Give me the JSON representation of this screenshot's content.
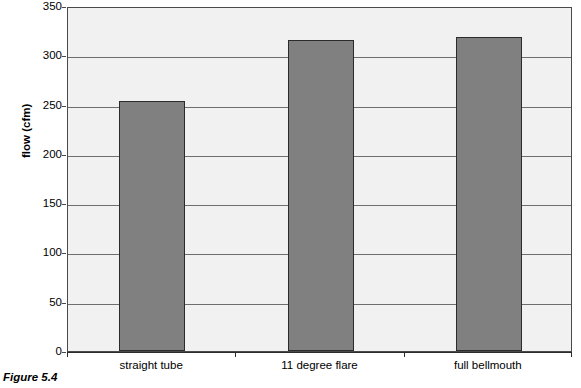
{
  "figure": {
    "caption": "Figure 5.4"
  },
  "chart_data": {
    "type": "bar",
    "title": "",
    "xlabel": "",
    "ylabel": "flow (cfm)",
    "categories": [
      "straight tube",
      "11 degree flare",
      "full bellmouth"
    ],
    "values": [
      254,
      316,
      319
    ],
    "series": [
      {
        "name": "flow",
        "values": [
          254,
          316,
          319
        ]
      }
    ],
    "ylim": [
      0,
      350
    ],
    "yticks": [
      0,
      50,
      100,
      150,
      200,
      250,
      300,
      350
    ],
    "ytick_labels": [
      "0",
      "50",
      "100",
      "150",
      "200",
      "250",
      "300",
      "350"
    ],
    "grid": true,
    "grid_axis": "y",
    "legend": false,
    "legend_position": "none",
    "bar_color": "#808080",
    "bar_edge_color": "#2b2b2b",
    "plot_background": "#f1f1f1",
    "grid_color": "#6e6e6e",
    "axis_color": "#2b2b2b"
  }
}
